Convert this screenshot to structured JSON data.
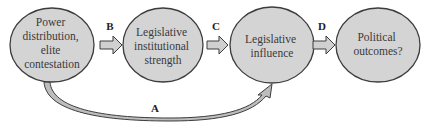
{
  "diagram": {
    "nodes": [
      {
        "id": "power",
        "lines": [
          "Power",
          "distribution,",
          "elite",
          "contestation"
        ]
      },
      {
        "id": "strength",
        "lines": [
          "Legislative",
          "institutional",
          "strength"
        ]
      },
      {
        "id": "influence",
        "lines": [
          "Legislative",
          "influence"
        ]
      },
      {
        "id": "outcomes",
        "lines": [
          "Political",
          "outcomes?"
        ]
      }
    ],
    "edges": [
      {
        "label": "B",
        "from": "power",
        "to": "strength"
      },
      {
        "label": "C",
        "from": "strength",
        "to": "influence"
      },
      {
        "label": "D",
        "from": "influence",
        "to": "outcomes"
      },
      {
        "label": "A",
        "from": "power",
        "to": "influence"
      }
    ]
  },
  "colors": {
    "node_fill": "#d4d4d4",
    "node_stroke": "#3c3c3c",
    "arrow_fill": "#d0d0d0",
    "arrow_stroke": "#3c3c3c"
  }
}
